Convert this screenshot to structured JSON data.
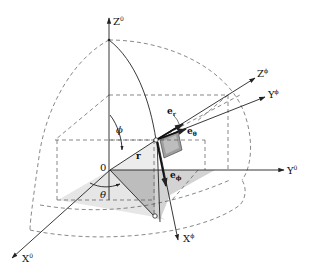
{
  "diagram": {
    "colors": {
      "line": "#222222",
      "dashed": "#555555",
      "shade_light": "#e6e6e6",
      "shade_mid": "#cfcfcf",
      "shade_dark": "#a9a9a9"
    },
    "axes": {
      "z0": {
        "base": "Z",
        "sup": "0"
      },
      "y0": {
        "base": "Y",
        "sup": "0"
      },
      "x0": {
        "base": "X",
        "sup": "0"
      },
      "zphi": {
        "base": "Z",
        "sup": "ϕ"
      },
      "yphi": {
        "base": "Y",
        "sup": "ϕ"
      },
      "xphi": {
        "base": "X",
        "sup": "ϕ"
      }
    },
    "labels": {
      "origin": "0",
      "phi": "ϕ",
      "theta": "θ",
      "r": "r",
      "e_r": {
        "base": "e",
        "sub": "r"
      },
      "e_theta": {
        "base": "e",
        "sub": "θ"
      },
      "e_phi": {
        "base": "e",
        "sub": "ϕ"
      }
    }
  }
}
